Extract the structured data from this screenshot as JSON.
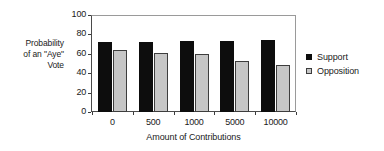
{
  "chart_data": {
    "type": "bar",
    "title": "",
    "xlabel": "Amount of Contributions",
    "ylabel": "Probability of an \"Aye\" Vote",
    "ylabel_lines": [
      "Probability",
      "of an \"Aye\"",
      "Vote"
    ],
    "categories": [
      "0",
      "500",
      "1000",
      "5000",
      "10000"
    ],
    "series": [
      {
        "name": "Support",
        "values": [
          72,
          72.5,
          73,
          73.5,
          74
        ],
        "color": "#0d0d0d"
      },
      {
        "name": "Opposition",
        "values": [
          64,
          60.5,
          60,
          53,
          48.5
        ],
        "color": "#c6c6c6"
      }
    ],
    "ylim": [
      0,
      100
    ],
    "yticks": [
      "0",
      "20",
      "40",
      "60",
      "80",
      "100"
    ],
    "grid": false,
    "legend_position": "right"
  },
  "legend": {
    "items": [
      {
        "label": "Support",
        "swatch": "support"
      },
      {
        "label": "Opposition",
        "swatch": "opposition"
      }
    ]
  }
}
